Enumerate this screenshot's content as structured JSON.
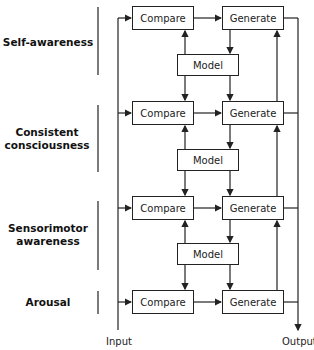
{
  "diagram": {
    "levels": [
      {
        "label": "Self-awareness"
      },
      {
        "label": "Consistent consciousness"
      },
      {
        "label": "Sensorimotor awareness"
      },
      {
        "label": "Arousal"
      }
    ],
    "compare_label": "Compare",
    "generate_label": "Generate",
    "model_label": "Model",
    "input_label": "Input",
    "output_label": "Output",
    "rows": [
      {
        "compare": "Compare",
        "generate": "Generate"
      },
      {
        "compare": "Compare",
        "generate": "Generate"
      },
      {
        "compare": "Compare",
        "generate": "Generate"
      },
      {
        "compare": "Compare",
        "generate": "Generate"
      }
    ],
    "models": [
      "Model",
      "Model",
      "Model"
    ],
    "line_color": "#222222"
  }
}
